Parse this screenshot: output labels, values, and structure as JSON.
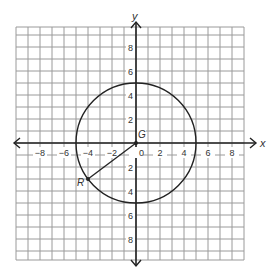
{
  "axes": {
    "x_label": "x",
    "y_label": "y",
    "range": [
      -9,
      9
    ],
    "x_ticks": [
      {
        "value": -8,
        "label": "−8"
      },
      {
        "value": -6,
        "label": "−6"
      },
      {
        "value": -4,
        "label": "−4"
      },
      {
        "value": -2,
        "label": "−2"
      },
      {
        "value": 0,
        "label": "0"
      },
      {
        "value": 2,
        "label": "2"
      },
      {
        "value": 4,
        "label": "4"
      },
      {
        "value": 6,
        "label": "6"
      },
      {
        "value": 8,
        "label": "8"
      }
    ],
    "y_ticks": [
      {
        "value": 8,
        "label": "8"
      },
      {
        "value": 6,
        "label": "6"
      },
      {
        "value": 4,
        "label": "4"
      },
      {
        "value": 2,
        "label": "2"
      },
      {
        "value": -2,
        "label": "2"
      },
      {
        "value": -4,
        "label": "4"
      },
      {
        "value": -6,
        "label": "6"
      },
      {
        "value": -8,
        "label": "8"
      }
    ]
  },
  "circle": {
    "center_label": "G",
    "center": [
      0,
      0
    ],
    "radius": 5
  },
  "point": {
    "label": "R",
    "coords": [
      -4,
      -3
    ]
  },
  "colors": {
    "grid": "#9a9a9a",
    "axis": "#222222",
    "curve": "#222222",
    "background": "#ffffff"
  }
}
